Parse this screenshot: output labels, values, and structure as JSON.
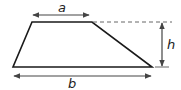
{
  "diagram": {
    "type": "trapezoid",
    "labels": {
      "top_base": "a",
      "bottom_base": "b",
      "height": "h"
    },
    "colors": {
      "shape_stroke": "#1a1a1a",
      "arrow": "#444444",
      "dashed": "#666666",
      "text": "#222222"
    }
  }
}
